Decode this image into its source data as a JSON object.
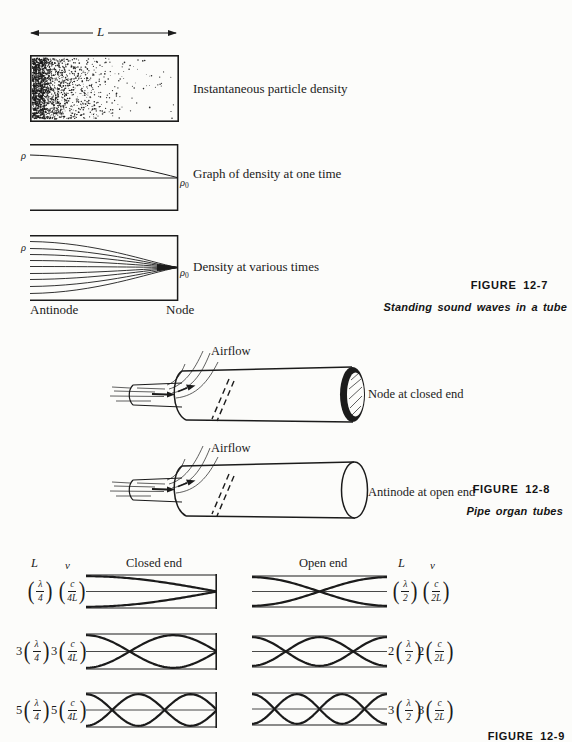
{
  "colors": {
    "ink": "#1b1b1b",
    "paper": "#fcfcfa"
  },
  "fig7": {
    "length_label": "L",
    "tube_caption": "Instantaneous particle density",
    "graph_caption": "Graph of density at one time",
    "fan_caption": "Density at various times",
    "rho": "ρ",
    "rho_zero_base": "ρ",
    "rho_zero_sub": "0",
    "antinode_label": "Antinode",
    "node_label": "Node",
    "figure_label": "FIGURE 12-7",
    "figure_caption": "Standing sound waves in a tube"
  },
  "fig8": {
    "airflow_label_top": "Airflow",
    "airflow_label_bottom": "Airflow",
    "closed_end_caption": "Node at closed end",
    "open_end_caption": "Antinode at open end",
    "figure_label": "FIGURE 12-8",
    "figure_caption": "Pipe organ tubes"
  },
  "fig9": {
    "closed_header": {
      "L": "L",
      "nu": "ν",
      "title": "Closed end"
    },
    "open_header": {
      "L": "L",
      "nu": "ν",
      "title": "Open end"
    },
    "closed_rows": [
      {
        "harmonic": 1,
        "wavelength": {
          "coef": "",
          "num": "λ",
          "den": "4"
        },
        "frequency": {
          "coef": "",
          "num": "c",
          "den": "4L"
        }
      },
      {
        "harmonic": 3,
        "wavelength": {
          "coef": "3",
          "num": "λ",
          "den": "4"
        },
        "frequency": {
          "coef": "3",
          "num": "c",
          "den": "4L"
        }
      },
      {
        "harmonic": 5,
        "wavelength": {
          "coef": "5",
          "num": "λ",
          "den": "4"
        },
        "frequency": {
          "coef": "5",
          "num": "c",
          "den": "4L"
        }
      }
    ],
    "open_rows": [
      {
        "harmonic": 1,
        "wavelength": {
          "coef": "",
          "num": "λ",
          "den": "2"
        },
        "frequency": {
          "coef": "",
          "num": "c",
          "den": "2L"
        }
      },
      {
        "harmonic": 2,
        "wavelength": {
          "coef": "2",
          "num": "λ",
          "den": "2"
        },
        "frequency": {
          "coef": "2",
          "num": "c",
          "den": "2L"
        }
      },
      {
        "harmonic": 3,
        "wavelength": {
          "coef": "3",
          "num": "λ",
          "den": "2"
        },
        "frequency": {
          "coef": "3",
          "num": "c",
          "den": "2L"
        }
      }
    ],
    "figure_label": "FIGURE 12-9"
  }
}
